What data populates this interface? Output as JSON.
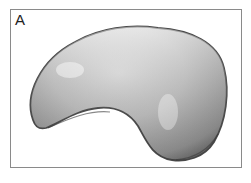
{
  "panel": {
    "label": "A",
    "subject": "kidney-bean-shaped 3D blob, grayscale shaded"
  },
  "colors": {
    "frame_border": "#8a8a8a",
    "shape_light": "#f2f2f2",
    "shape_mid": "#bdbdbd",
    "shape_dark": "#555555"
  }
}
